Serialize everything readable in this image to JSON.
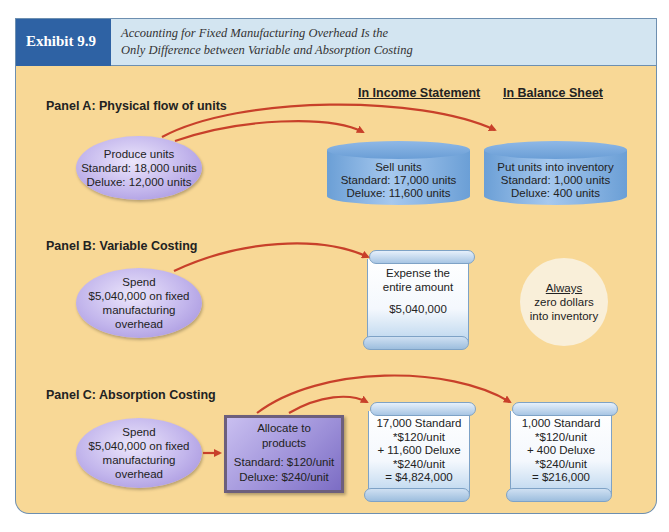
{
  "header": {
    "exhibit_label": "Exhibit 9.9",
    "title_line1": "Accounting for Fixed Manufacturing Overhead Is the",
    "title_line2": "Only Difference between Variable and Absorption Costing"
  },
  "columns": {
    "income_statement": "In Income Statement",
    "balance_sheet": "In Balance Sheet"
  },
  "panel_a": {
    "label": "Panel A: Physical flow of units",
    "produce": {
      "line1": "Produce units",
      "line2": "Standard: 18,000 units",
      "line3": "Deluxe: 12,000 units"
    },
    "sell": {
      "line1": "Sell units",
      "line2": "Standard: 17,000 units",
      "line3": "Deluxe: 11,600 units"
    },
    "inventory": {
      "line1": "Put units into inventory",
      "line2": "Standard: 1,000 units",
      "line3": "Deluxe: 400 units"
    }
  },
  "panel_b": {
    "label": "Panel B: Variable Costing",
    "spend": {
      "line1": "Spend",
      "line2": "$5,040,000 on fixed",
      "line3": "manufacturing",
      "line4": "overhead"
    },
    "expense": {
      "line1": "Expense the",
      "line2": "entire amount",
      "line3": "$5,040,000"
    },
    "always": {
      "line1": "Always",
      "line2": "zero dollars",
      "line3": "into inventory"
    }
  },
  "panel_c": {
    "label": "Panel C: Absorption Costing",
    "spend": {
      "line1": "Spend",
      "line2": "$5,040,000 on fixed",
      "line3": "manufacturing",
      "line4": "overhead"
    },
    "allocate": {
      "line1": "Allocate to",
      "line2": "products",
      "line3": "Standard: $120/unit",
      "line4": "Deluxe: $240/unit"
    },
    "income": {
      "line1": "17,000 Standard",
      "line2": "*$120/unit",
      "line3": "+ 11,600 Deluxe",
      "line4": "*$240/unit",
      "line5": "= $4,824,000"
    },
    "balance": {
      "line1": "1,000 Standard",
      "line2": "*$120/unit",
      "line3": "+ 400 Deluxe",
      "line4": "*$240/unit",
      "line5": "= $216,000"
    }
  },
  "colors": {
    "header_tag": "#2e62a4",
    "header_bg": "#d3e5f1",
    "panel_bg": "#f8d896",
    "arrow": "#c8402a",
    "oval": "#c2b5ec",
    "cylinder": "#6b9fd6"
  }
}
